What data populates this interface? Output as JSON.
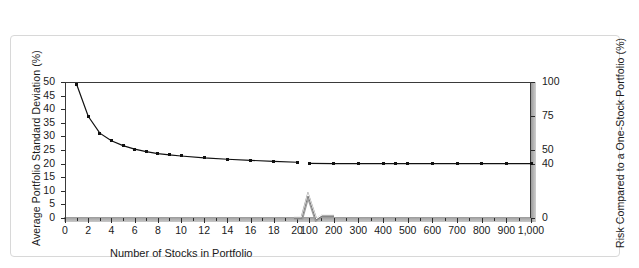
{
  "figure": {
    "frame_color": "#d8d8d8",
    "axis_color": "#2b2b2b",
    "marker_color": "#111111"
  },
  "axes": {
    "left_title": "Average Portfolio Standard Deviation (%)",
    "right_title": "Risk Compared to a One-Stock Portfolio (%)",
    "x_title": "Number of Stocks in Portfolio",
    "left_ticks": [
      "0",
      "5",
      "10",
      "15",
      "20",
      "25",
      "30",
      "35",
      "40",
      "45",
      "50"
    ],
    "right_ticks": [
      "0",
      "40",
      "50",
      "75",
      "100"
    ],
    "x_ticks_segment1": [
      "0",
      "2",
      "4",
      "6",
      "8",
      "10",
      "12",
      "14",
      "16",
      "18",
      "20"
    ],
    "x_ticks_segment2": [
      "100",
      "200",
      "300",
      "400",
      "500",
      "600",
      "700",
      "800",
      "900",
      "1,000"
    ],
    "axis_break_label": "axis-break-zigzag"
  },
  "chart_data": {
    "type": "line",
    "title": "",
    "xlabel": "Number of Stocks in Portfolio",
    "ylabel": "Average Portfolio Standard Deviation (%)",
    "y2label": "Risk Compared to a One-Stock Portfolio (%)",
    "ylim": [
      0,
      50
    ],
    "y2lim": [
      0,
      100
    ],
    "grid": false,
    "legend": "none",
    "axis_break": {
      "after_x": 20,
      "resume_x": 100
    },
    "xticks_segment1": [
      0,
      2,
      4,
      6,
      8,
      10,
      12,
      14,
      16,
      18,
      20
    ],
    "xticks_segment2": [
      100,
      200,
      300,
      400,
      500,
      600,
      700,
      800,
      900,
      1000
    ],
    "yticks": [
      0,
      5,
      10,
      15,
      20,
      25,
      30,
      35,
      40,
      45,
      50
    ],
    "y2ticks": [
      0,
      40,
      50,
      75,
      100
    ],
    "series": [
      {
        "name": "Average portfolio standard deviation (1-20 stocks)",
        "x": [
          1,
          2,
          3,
          4,
          5,
          6,
          7,
          8,
          9,
          10,
          12,
          14,
          16,
          18,
          20
        ],
        "values": [
          49.2,
          37.4,
          31.2,
          28.4,
          26.6,
          25.3,
          24.4,
          23.7,
          23.2,
          22.8,
          22.1,
          21.6,
          21.2,
          20.8,
          20.5
        ]
      },
      {
        "name": "Average portfolio standard deviation (100-1000 stocks)",
        "x": [
          100,
          200,
          300,
          400,
          450,
          500,
          600,
          700,
          800,
          900,
          1000
        ],
        "values": [
          20.1,
          20.0,
          20.0,
          20.0,
          20.0,
          20.0,
          20.0,
          20.0,
          20.0,
          20.0,
          20.0
        ]
      }
    ]
  }
}
